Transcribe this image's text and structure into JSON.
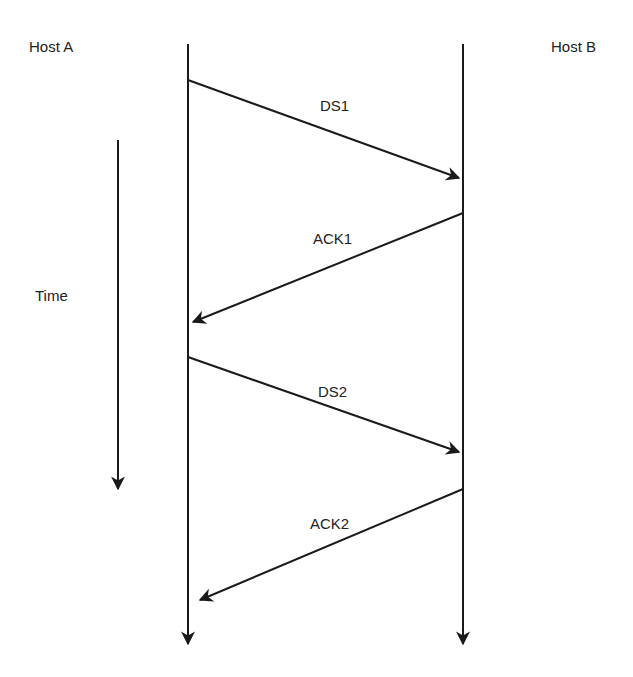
{
  "diagram": {
    "hosts": [
      {
        "label": "Host A",
        "x": 188
      },
      {
        "label": "Host B",
        "x": 463
      }
    ],
    "time_label": "Time",
    "messages": [
      {
        "label": "DS1",
        "from": "Host A",
        "to": "Host B",
        "x1": 188,
        "y1": 80,
        "x2": 459,
        "y2": 178
      },
      {
        "label": "ACK1",
        "from": "Host B",
        "to": "Host A",
        "x1": 463,
        "y1": 213,
        "x2": 193,
        "y2": 322
      },
      {
        "label": "DS2",
        "from": "Host A",
        "to": "Host B",
        "x1": 188,
        "y1": 357,
        "x2": 459,
        "y2": 452
      },
      {
        "label": "ACK2",
        "from": "Host B",
        "to": "Host A",
        "x1": 463,
        "y1": 489,
        "x2": 200,
        "y2": 600
      }
    ],
    "line_color": "#1a1a1a"
  }
}
